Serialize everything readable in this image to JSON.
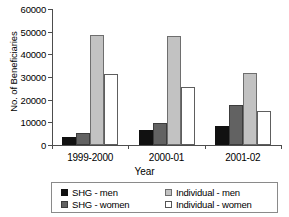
{
  "chart_data": {
    "type": "bar",
    "title": "",
    "xlabel": "Year",
    "ylabel": "No. of Beneficiaries",
    "categories": [
      "1999-2000",
      "2000-01",
      "2001-02"
    ],
    "series": [
      {
        "name": "SHG - men",
        "color": "#111111",
        "values": [
          3400,
          6700,
          8600
        ]
      },
      {
        "name": "SHG - women",
        "color": "#626262",
        "values": [
          5500,
          9500,
          17800
        ]
      },
      {
        "name": "Individual - men",
        "color": "#c2c2c2",
        "values": [
          48400,
          48200,
          31700
        ]
      },
      {
        "name": "Individual - women",
        "color": "#ffffff",
        "values": [
          31200,
          25400,
          14900
        ]
      }
    ],
    "ylim": [
      0,
      60000
    ],
    "yticks": [
      0,
      10000,
      20000,
      30000,
      40000,
      50000,
      60000
    ],
    "ytick_labels": [
      "0",
      "10000",
      "20000",
      "30000",
      "40000",
      "50000",
      "60000"
    ],
    "grid": false,
    "legend_position": "bottom",
    "legend_layout": "2x2"
  }
}
